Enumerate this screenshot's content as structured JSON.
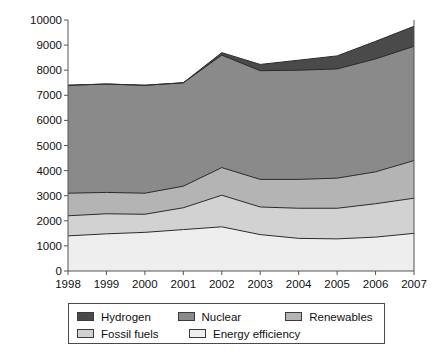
{
  "chart_data": {
    "type": "area",
    "stacked": true,
    "title": "",
    "subtitle": "",
    "xlabel": "",
    "ylabel": "",
    "grid": false,
    "legend_position": "bottom",
    "categories": [
      1998,
      1999,
      2000,
      2001,
      2002,
      2003,
      2004,
      2005,
      2006,
      2007
    ],
    "x_tick_labels": [
      "1998",
      "1999",
      "2000",
      "2001",
      "2002",
      "2003",
      "2004",
      "2005",
      "2006",
      "2007"
    ],
    "y_tick_labels": [
      "0",
      "1000",
      "2000",
      "3000",
      "4000",
      "5000",
      "6000",
      "7000",
      "8000",
      "9000",
      "10000"
    ],
    "y_ticks": [
      0,
      1000,
      2000,
      3000,
      4000,
      5000,
      6000,
      7000,
      8000,
      9000,
      10000
    ],
    "xlim": [
      1998,
      2007
    ],
    "ylim": [
      0,
      10000
    ],
    "stack_order_bottom_to_top": [
      "Energy efficiency",
      "Fossil fuels",
      "Renewables",
      "Nuclear",
      "Hydrogen"
    ],
    "series": [
      {
        "name": "Energy efficiency",
        "color": "#eeeeee",
        "values": [
          1400,
          1480,
          1540,
          1650,
          1760,
          1450,
          1300,
          1280,
          1350,
          1500
        ]
      },
      {
        "name": "Fossil fuels",
        "color": "#d2d2d2",
        "values": [
          800,
          800,
          720,
          870,
          1260,
          1100,
          1200,
          1220,
          1330,
          1400
        ]
      },
      {
        "name": "Renewables",
        "color": "#b4b4b4",
        "values": [
          900,
          850,
          840,
          860,
          1100,
          1100,
          1150,
          1200,
          1270,
          1500
        ]
      },
      {
        "name": "Nuclear",
        "color": "#8a8a8a",
        "values": [
          4300,
          4320,
          4300,
          4120,
          4480,
          4330,
          4350,
          4350,
          4500,
          4550
        ]
      },
      {
        "name": "Hydrogen",
        "color": "#4a4a4a",
        "values": [
          0,
          0,
          0,
          0,
          100,
          250,
          400,
          520,
          700,
          800
        ]
      }
    ],
    "cumulative_tops": {
      "Energy efficiency": [
        1400,
        1480,
        1540,
        1650,
        1760,
        1450,
        1300,
        1280,
        1350,
        1500
      ],
      "Fossil fuels": [
        2200,
        2280,
        2260,
        2520,
        3020,
        2550,
        2500,
        2500,
        2680,
        2900
      ],
      "Renewables": [
        3100,
        3130,
        3100,
        3380,
        4120,
        3650,
        3650,
        3700,
        3950,
        4400
      ],
      "Nuclear": [
        7400,
        7450,
        7400,
        7500,
        8600,
        7980,
        8000,
        8050,
        8450,
        8950
      ],
      "Hydrogen": [
        7400,
        7450,
        7400,
        7500,
        8700,
        8230,
        8400,
        8570,
        9150,
        9750
      ]
    }
  },
  "legend": {
    "items": [
      {
        "label": "Hydrogen",
        "color": "#4a4a4a"
      },
      {
        "label": "Nuclear",
        "color": "#8a8a8a"
      },
      {
        "label": "Renewables",
        "color": "#b4b4b4"
      },
      {
        "label": "Fossil fuels",
        "color": "#d2d2d2"
      },
      {
        "label": "Energy efficiency",
        "color": "#eeeeee"
      }
    ]
  },
  "axes": {
    "axis_color": "#555555",
    "line_color": "#2b2b2b"
  }
}
